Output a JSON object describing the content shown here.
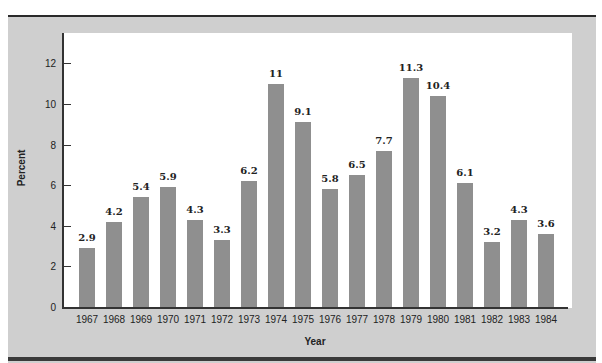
{
  "chart_data": {
    "type": "bar",
    "title": "",
    "xlabel": "Year",
    "ylabel": "Percent",
    "ylim": [
      0,
      13.5
    ],
    "yticks": [
      0,
      2,
      4,
      6,
      8,
      10,
      12
    ],
    "grid": false,
    "legend": null,
    "categories": [
      "1967",
      "1968",
      "1969",
      "1970",
      "1971",
      "1972",
      "1973",
      "1974",
      "1975",
      "1976",
      "1977",
      "1978",
      "1979",
      "1980",
      "1981",
      "1982",
      "1983",
      "1984"
    ],
    "values": [
      2.9,
      4.2,
      5.4,
      5.9,
      4.3,
      3.3,
      6.2,
      11,
      9.1,
      5.8,
      6.5,
      7.7,
      11.3,
      10.4,
      6.1,
      3.2,
      4.3,
      3.6
    ],
    "value_labels": [
      "2.9",
      "4.2",
      "5.4",
      "5.9",
      "4.3",
      "3.3",
      "6.2",
      "11",
      "9.1",
      "5.8",
      "6.5",
      "7.7",
      "11.3",
      "10.4",
      "6.1",
      "3.2",
      "4.3",
      "3.6"
    ],
    "colors": {
      "bar": "#8f8f8f",
      "panel": "#cfcfcf",
      "plot_bg": "#ffffff"
    }
  },
  "axis": {
    "y_title": "Percent",
    "x_title": "Year",
    "y_ticks": [
      "0",
      "2",
      "4",
      "6",
      "8",
      "10",
      "12"
    ]
  }
}
